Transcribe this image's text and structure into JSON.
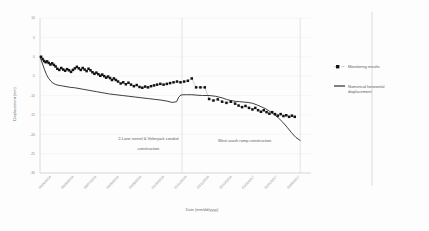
{
  "chart_data": {
    "type": "line",
    "title": "",
    "xlabel": "Date (mm/dd/yyyy)",
    "ylabel": "Displacement (mm)",
    "ylim": [
      -30,
      10
    ],
    "yticks": [
      10,
      5,
      0,
      -5,
      -10,
      -15,
      -20,
      -25,
      -30
    ],
    "ytick_labels": [
      "10",
      "5",
      "0",
      "-5",
      "-10",
      "-15",
      "-20",
      "-25",
      "-30"
    ],
    "grid": true,
    "legend_position": "right",
    "xtick_labels": [
      "04/04/2016",
      "06/05/2016",
      "06/07/2016",
      "04/08/2016",
      "04/09/2016",
      "01/10/2016",
      "01/11/2016",
      "02/11/2016",
      "02/12/2016",
      "01/02/2017",
      "31/01/2017",
      "02/03/2017"
    ],
    "series": [
      {
        "name": "Monitoring results",
        "style": "markers",
        "x": [
          0.5,
          1.2,
          1.9,
          2.6,
          3.3,
          4.0,
          4.8,
          5.6,
          6.4,
          7.2,
          8.0,
          8.9,
          9.8,
          10.7,
          11.6,
          12.5,
          13.4,
          14.3,
          15.2,
          16.1,
          17.0,
          17.9,
          18.8,
          19.7,
          20.6,
          21.5,
          22.4,
          23.3,
          24.2,
          25.1,
          26.0,
          26.9,
          27.8,
          28.7,
          29.6,
          30.5,
          31.4,
          32.3,
          33.2,
          34.1,
          35.0,
          36.0,
          37.2,
          38.4,
          39.6,
          40.8,
          42.0,
          43.3,
          44.6,
          45.9,
          47.2,
          48.5,
          49.8,
          51.2,
          52.6,
          54.0,
          55.5,
          57.0,
          58.5,
          60.0,
          61.6,
          63.2,
          64.8,
          66.5,
          68.2,
          70.0,
          72.0,
          74.0,
          76.0,
          78.0,
          80.0,
          82.0,
          84.0,
          86.0,
          88.0,
          90.0,
          91.6,
          93.2,
          94.8,
          96.4,
          98.0,
          99.3,
          100.6,
          101.9,
          103.2,
          104.5,
          105.8,
          107.1,
          108.4,
          109.7,
          111.0,
          112.3,
          113.6,
          114.9,
          116.2,
          117.5
        ],
        "y": [
          0.0,
          -0.6,
          -1.1,
          -1.4,
          -1.2,
          -1.6,
          -2.0,
          -1.7,
          -2.1,
          -2.5,
          -3.1,
          -3.4,
          -2.9,
          -3.3,
          -3.6,
          -3.2,
          -3.5,
          -3.9,
          -3.4,
          -3.0,
          -2.6,
          -3.0,
          -3.4,
          -2.9,
          -3.3,
          -3.7,
          -3.1,
          -3.5,
          -4.0,
          -4.4,
          -4.1,
          -4.5,
          -4.9,
          -4.6,
          -5.0,
          -5.4,
          -5.1,
          -5.5,
          -6.0,
          -5.6,
          -6.0,
          -6.4,
          -6.9,
          -6.6,
          -7.1,
          -6.7,
          -7.2,
          -7.6,
          -7.3,
          -7.8,
          -8.0,
          -7.7,
          -7.9,
          -7.6,
          -7.4,
          -7.2,
          -7.0,
          -7.2,
          -7.0,
          -6.8,
          -6.6,
          -6.4,
          -6.6,
          -6.4,
          -6.2,
          -5.6,
          -7.9,
          -7.9,
          -7.9,
          -10.9,
          -11.3,
          -11.0,
          -11.6,
          -11.9,
          -11.6,
          -12.1,
          -12.6,
          -13.0,
          -12.7,
          -13.2,
          -13.6,
          -13.2,
          -13.8,
          -14.2,
          -13.8,
          -14.3,
          -14.7,
          -14.3,
          -14.8,
          -15.2,
          -14.8,
          -15.3,
          -15.1,
          -15.5,
          -15.2,
          -15.5
        ]
      },
      {
        "name": "Numerical horizontal displacement",
        "style": "line",
        "x": [
          0,
          1,
          2,
          3,
          4,
          5,
          6,
          7,
          8,
          10,
          12,
          14,
          16,
          18,
          20,
          23,
          26,
          29,
          32,
          35,
          38,
          41,
          44,
          47,
          50,
          53,
          56,
          59,
          61,
          63,
          64,
          65,
          66,
          67,
          68,
          70,
          72,
          75,
          78,
          81,
          84,
          86,
          88,
          90,
          92,
          94,
          96,
          98,
          100,
          102,
          104,
          106,
          108,
          110,
          112,
          114,
          116,
          118,
          120
        ],
        "y": [
          0.0,
          -1.6,
          -3.2,
          -4.6,
          -5.6,
          -6.3,
          -6.8,
          -7.1,
          -7.3,
          -7.5,
          -7.7,
          -7.9,
          -8.0,
          -8.2,
          -8.4,
          -8.7,
          -9.0,
          -9.3,
          -9.6,
          -9.8,
          -10.0,
          -10.2,
          -10.4,
          -10.6,
          -10.8,
          -11.0,
          -11.2,
          -11.5,
          -11.8,
          -11.6,
          -10.4,
          -9.9,
          -9.8,
          -9.8,
          -9.8,
          -9.8,
          -9.9,
          -10.0,
          -10.0,
          -10.2,
          -10.6,
          -11.0,
          -11.3,
          -11.5,
          -11.6,
          -11.7,
          -11.8,
          -12.0,
          -12.4,
          -12.9,
          -13.4,
          -14.1,
          -14.9,
          -15.8,
          -16.9,
          -18.2,
          -19.6,
          -20.8,
          -21.6
        ]
      }
    ],
    "annotations": [
      {
        "text": "2-Lane tunnel & Velenjack conduit",
        "x": 0.4,
        "y": 0.79
      },
      {
        "text": "construction",
        "x": 0.4,
        "y": 0.85
      },
      {
        "text": "West arash ramp construction",
        "x": 0.755,
        "y": 0.8
      }
    ],
    "dividers": [
      65.5,
      120.0
    ]
  },
  "legend": {
    "items": [
      {
        "label": "Monitoring results",
        "marker": "square-dot",
        "color": "#111111"
      },
      {
        "label": "Numerical horizontal",
        "marker": "line",
        "color": "#1b1b1b"
      },
      {
        "label": "displacement",
        "marker": "",
        "color": "#1b1b1b"
      }
    ]
  },
  "colors": {
    "monitoring": "#111111",
    "numerical": "#1b1b1b",
    "grid": "#eaeaea",
    "axis": "#b8b8b8",
    "text": "#8a8a8a"
  }
}
